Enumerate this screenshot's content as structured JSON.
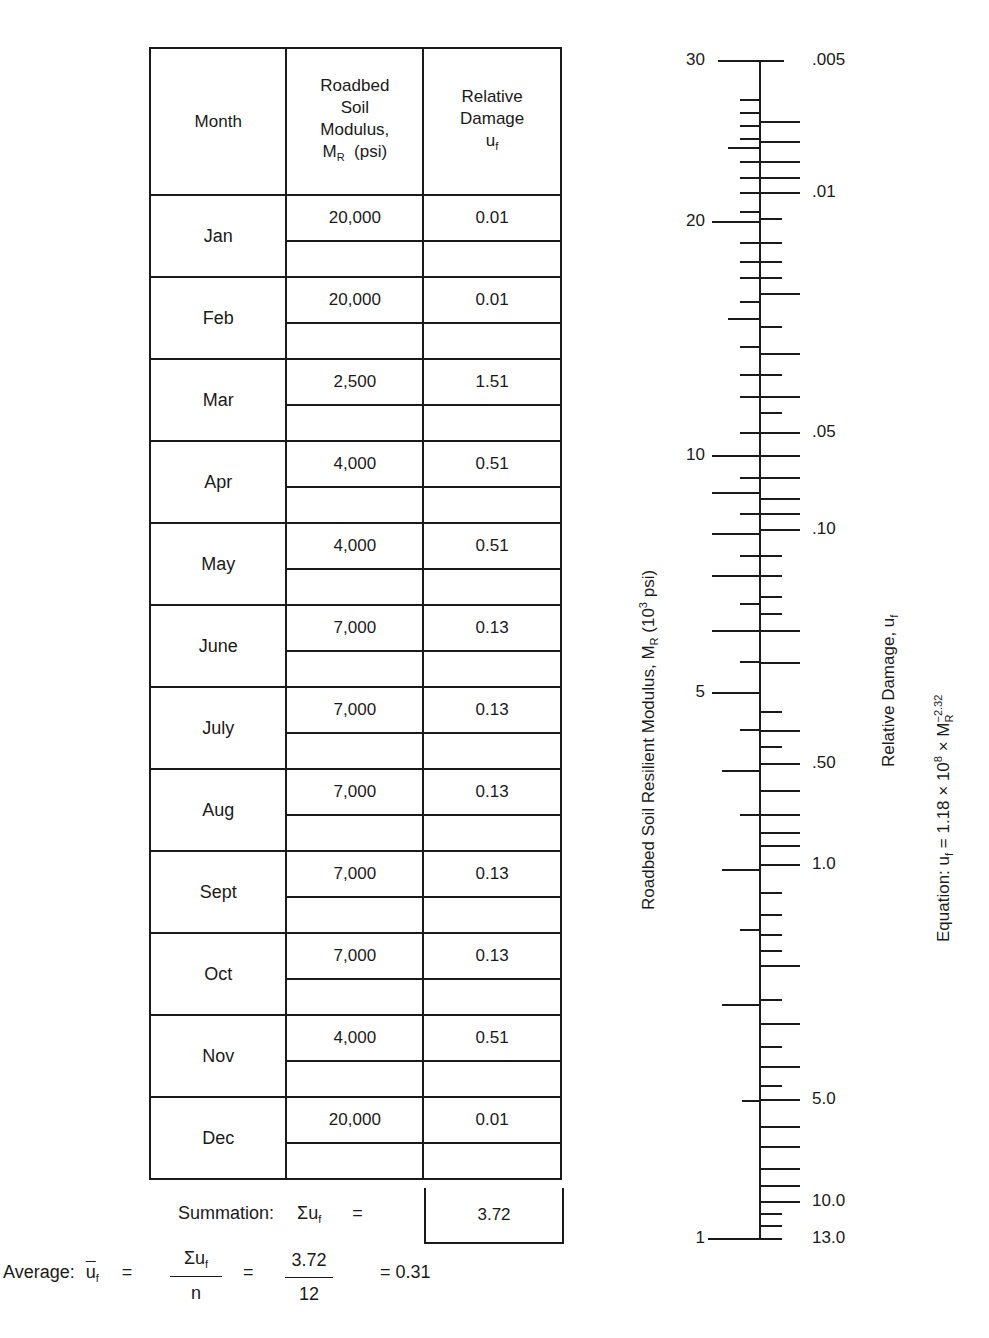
{
  "table": {
    "headers": {
      "month": "Month",
      "modulus_line1": "Roadbed",
      "modulus_line2": "Soil",
      "modulus_line3": "Modulus,",
      "modulus_symbol": "M",
      "modulus_sub": "R",
      "modulus_unit": "(psi)",
      "damage_line1": "Relative",
      "damage_line2": "Damage",
      "damage_symbol": "u",
      "damage_sub": "f"
    },
    "rows": [
      {
        "month": "Jan",
        "modulus": "20,000",
        "damage": "0.01"
      },
      {
        "month": "Feb",
        "modulus": "20,000",
        "damage": "0.01"
      },
      {
        "month": "Mar",
        "modulus": "2,500",
        "damage": "1.51"
      },
      {
        "month": "Apr",
        "modulus": "4,000",
        "damage": "0.51"
      },
      {
        "month": "May",
        "modulus": "4,000",
        "damage": "0.51"
      },
      {
        "month": "June",
        "modulus": "7,000",
        "damage": "0.13"
      },
      {
        "month": "July",
        "modulus": "7,000",
        "damage": "0.13"
      },
      {
        "month": "Aug",
        "modulus": "7,000",
        "damage": "0.13"
      },
      {
        "month": "Sept",
        "modulus": "7,000",
        "damage": "0.13"
      },
      {
        "month": "Oct",
        "modulus": "7,000",
        "damage": "0.13"
      },
      {
        "month": "Nov",
        "modulus": "4,000",
        "damage": "0.51"
      },
      {
        "month": "Dec",
        "modulus": "20,000",
        "damage": "0.01"
      }
    ]
  },
  "summation": {
    "label": "Summation:",
    "symbol": "Σu",
    "symbol_sub": "f",
    "equals": "=",
    "value": "3.72"
  },
  "average": {
    "label": "Average:",
    "symbol": "u",
    "symbol_sub": "f",
    "eq1": "=",
    "numerator": "Σu",
    "numerator_sub": "f",
    "denominator": "n",
    "eq2": "=",
    "num_value": "3.72",
    "den_value": "12",
    "result": "= 0.31"
  },
  "nomograph": {
    "left_axis_title": "Roadbed Soil Resilient Modulus, M",
    "left_axis_title_sub": "R",
    "left_axis_title_unit_pre": " (10",
    "left_axis_title_unit_sup": "3",
    "left_axis_title_unit_post": " psi)",
    "right_axis_title": "Relative Damage, u",
    "right_axis_title_sub": "f",
    "equation_pre": "Equation: u",
    "equation_sub_f": "f",
    "equation_mid": " = 1.18 × 10",
    "equation_sup_8": "8",
    "equation_x": " × M",
    "equation_sub_r": "R",
    "equation_sup_exp": "−2.32",
    "left_labels": [
      {
        "text": "30",
        "y": 61
      },
      {
        "text": "20",
        "y": 222
      },
      {
        "text": "10",
        "y": 456
      },
      {
        "text": "5",
        "y": 693
      },
      {
        "text": "1",
        "y": 1239
      }
    ],
    "right_labels": [
      {
        "text": ".005",
        "y": 61
      },
      {
        "text": ".01",
        "y": 193
      },
      {
        "text": ".05",
        "y": 433
      },
      {
        "text": ".10",
        "y": 530
      },
      {
        "text": ".50",
        "y": 764
      },
      {
        "text": "1.0",
        "y": 865
      },
      {
        "text": "5.0",
        "y": 1100
      },
      {
        "text": "10.0",
        "y": 1202
      },
      {
        "text": "13.0",
        "y": 1239
      }
    ]
  },
  "chart_data": {
    "type": "table",
    "columns": [
      "Month",
      "Roadbed Soil Modulus, M_R (psi)",
      "Relative Damage u_f"
    ],
    "categories": [
      "Jan",
      "Feb",
      "Mar",
      "Apr",
      "May",
      "June",
      "July",
      "Aug",
      "Sept",
      "Oct",
      "Nov",
      "Dec"
    ],
    "series": [
      {
        "name": "M_R (psi)",
        "values": [
          20000,
          20000,
          2500,
          4000,
          4000,
          7000,
          7000,
          7000,
          7000,
          7000,
          4000,
          20000
        ]
      },
      {
        "name": "u_f",
        "values": [
          0.01,
          0.01,
          1.51,
          0.51,
          0.51,
          0.13,
          0.13,
          0.13,
          0.13,
          0.13,
          0.51,
          0.01
        ]
      }
    ],
    "sum_uf": 3.72,
    "n": 12,
    "average_uf": 0.31,
    "nomograph": {
      "left_axis": "Roadbed Soil Resilient Modulus, M_R (10^3 psi)",
      "left_ticks": [
        30,
        20,
        10,
        5,
        1
      ],
      "right_axis": "Relative Damage, u_f",
      "right_ticks": [
        0.005,
        0.01,
        0.05,
        0.1,
        0.5,
        1.0,
        5.0,
        10.0,
        13.0
      ],
      "equation": "u_f = 1.18 × 10^8 × M_R^-2.32"
    }
  }
}
